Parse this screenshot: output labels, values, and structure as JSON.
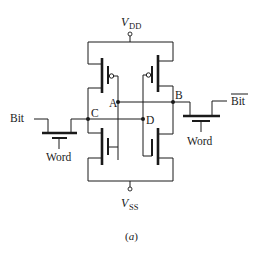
{
  "figure": {
    "caption": "(a)",
    "caption_paren_open": "(",
    "caption_letter": "a",
    "caption_paren_close": ")",
    "type": "SRAM 6T cell schematic"
  },
  "supplies": {
    "vdd": {
      "symbol": "V",
      "subscript": "DD"
    },
    "vss": {
      "symbol": "V",
      "subscript": "SS"
    }
  },
  "nodes": {
    "a": "A",
    "b": "B",
    "c": "C",
    "d": "D"
  },
  "signals": {
    "bit": "Bit",
    "bit_bar": "Bit",
    "word_left": "Word",
    "word_right": "Word"
  },
  "transistors": [
    {
      "id": "pmos-left",
      "type": "PMOS",
      "gate_node": "A",
      "drain_node": "C"
    },
    {
      "id": "pmos-right",
      "type": "PMOS",
      "gate_node": "D",
      "drain_node": "B"
    },
    {
      "id": "nmos-left",
      "type": "NMOS",
      "gate_node": "A",
      "drain_node": "C"
    },
    {
      "id": "nmos-right",
      "type": "NMOS",
      "gate_node": "D",
      "drain_node": "B"
    },
    {
      "id": "access-left",
      "type": "NMOS",
      "gate": "Word",
      "connects": [
        "Bit",
        "C"
      ]
    },
    {
      "id": "access-right",
      "type": "NMOS",
      "gate": "Word",
      "connects": [
        "B",
        "Bit-bar"
      ]
    }
  ],
  "colors": {
    "ink": "#1a1a1a",
    "background": "#ffffff"
  }
}
